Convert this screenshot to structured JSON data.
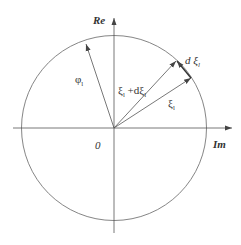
{
  "diagram": {
    "axes": {
      "vertical_label": "Re",
      "horizontal_label": "Im",
      "origin_label": "0"
    },
    "vectors": [
      {
        "name": "phi",
        "label": "φ",
        "subscript": "l"
      },
      {
        "name": "xi-plus-dxi",
        "label": "ξ",
        "subscript": "l",
        "mid": " +d",
        "label2": "ξ",
        "subscript2": "l"
      },
      {
        "name": "xi",
        "label": "ξ",
        "subscript": "l"
      },
      {
        "name": "dxi",
        "label": "d ξ",
        "subscript": "l"
      }
    ],
    "colors": {
      "line": "#555555",
      "text": "#333333"
    }
  }
}
